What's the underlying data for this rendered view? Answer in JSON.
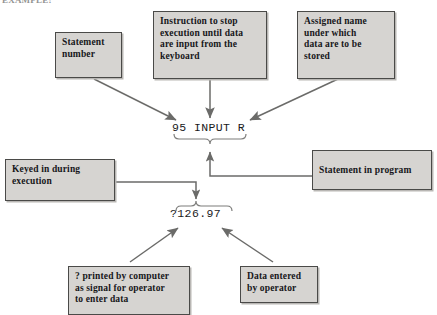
{
  "figure": {
    "heading": "EXAMPLE:",
    "kind": "annotated-code-callout-diagram"
  },
  "code": {
    "statement": "95 INPUT R",
    "prompt_output": "?126.97"
  },
  "callouts": {
    "statement_number": "Statement\nnumber",
    "instruction": "Instruction to stop\nexecution until data\nare input from the\nkeyboard",
    "assigned_name": "Assigned name\nunder which\ndata are to be\nstored",
    "keyed_in": "Keyed in during\nexecution",
    "statement_in_program": "Statement in program",
    "question_mark": "? printed by computer\nas signal for operator\nto enter data",
    "data_entered": "Data entered\nby operator"
  },
  "colors": {
    "box_fill": "#d6d4d1",
    "box_border": "#4a4a48",
    "box_shadow": "#b9b7b4",
    "ink": "#17171a",
    "wire": "#6b6b69",
    "page_background": "#ffffff"
  },
  "braces": {
    "under_statement": "downward-curly-brace",
    "over_prompt": "upward-curly-brace"
  },
  "arrows": [
    {
      "name": "statement-number-to-code",
      "from": "statement_number",
      "to": "statement",
      "style": "diagonal"
    },
    {
      "name": "instruction-to-code",
      "from": "instruction",
      "to": "statement",
      "style": "vertical"
    },
    {
      "name": "assigned-name-to-code",
      "from": "assigned_name",
      "to": "statement",
      "style": "diagonal"
    },
    {
      "name": "statement-in-program-to-brace",
      "from": "statement_in_program",
      "to": "under_statement",
      "style": "elbow"
    },
    {
      "name": "keyed-in-to-prompt",
      "from": "keyed_in",
      "to": "over_prompt",
      "style": "elbow"
    },
    {
      "name": "question-mark-to-prompt",
      "from": "question_mark",
      "to": "prompt_output",
      "style": "diagonal"
    },
    {
      "name": "data-entered-to-prompt",
      "from": "data_entered",
      "to": "prompt_output",
      "style": "diagonal"
    }
  ]
}
